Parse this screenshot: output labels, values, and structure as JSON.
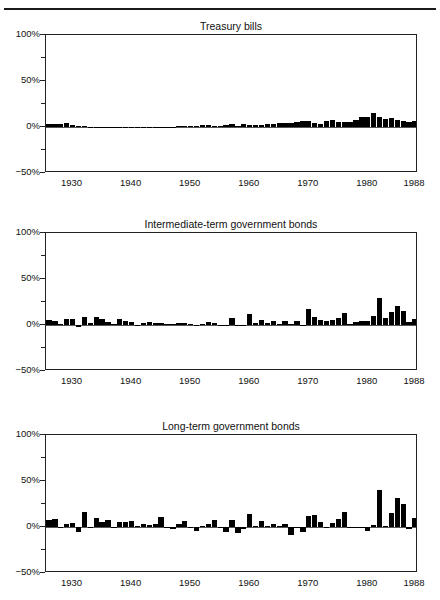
{
  "header": {
    "text": "",
    "rule": true
  },
  "figure": {
    "y_axis": {
      "labels": [
        "100%",
        "50%",
        "0%",
        "−50%"
      ],
      "values": [
        100,
        50,
        0,
        -50
      ],
      "minor_values": [
        75,
        25,
        -25
      ],
      "min": -50,
      "max": 100
    },
    "x_axis": {
      "labels": [
        "1930",
        "1940",
        "1950",
        "1960",
        "1970",
        "1980",
        "1988"
      ],
      "values": [
        1930,
        1940,
        1950,
        1960,
        1970,
        1980,
        1988
      ],
      "min": 1925.5,
      "max": 1988.5
    },
    "colors": {
      "bar": "#000000",
      "axis": "#222222",
      "zero_line": "#555555",
      "text": "#111111"
    }
  },
  "chart_data": [
    {
      "type": "bar",
      "title": "Treasury bills",
      "xlabel": "",
      "ylabel": "",
      "ylim": [
        -50,
        100
      ],
      "xlim": [
        1925.5,
        1988.5
      ],
      "grid": false,
      "legend": "none",
      "x": [
        1926,
        1927,
        1928,
        1929,
        1930,
        1931,
        1932,
        1933,
        1934,
        1935,
        1936,
        1937,
        1938,
        1939,
        1940,
        1941,
        1942,
        1943,
        1944,
        1945,
        1946,
        1947,
        1948,
        1949,
        1950,
        1951,
        1952,
        1953,
        1954,
        1955,
        1956,
        1957,
        1958,
        1959,
        1960,
        1961,
        1962,
        1963,
        1964,
        1965,
        1966,
        1967,
        1968,
        1969,
        1970,
        1971,
        1972,
        1973,
        1974,
        1975,
        1976,
        1977,
        1978,
        1979,
        1980,
        1981,
        1982,
        1983,
        1984,
        1985,
        1986,
        1987,
        1988
      ],
      "values": [
        3.3,
        3.1,
        3.2,
        4.7,
        2.4,
        1.1,
        1.0,
        0.3,
        0.2,
        0.2,
        0.2,
        0.3,
        0.0,
        0.0,
        0.0,
        0.1,
        0.3,
        0.4,
        0.3,
        0.3,
        0.4,
        0.5,
        0.8,
        1.1,
        1.2,
        1.5,
        1.7,
        1.8,
        0.9,
        1.6,
        2.5,
        3.1,
        1.5,
        3.0,
        2.7,
        2.1,
        2.7,
        3.1,
        3.5,
        3.9,
        4.8,
        4.2,
        5.2,
        6.6,
        6.5,
        4.4,
        3.8,
        6.9,
        8.0,
        5.8,
        5.1,
        5.1,
        7.2,
        10.4,
        11.2,
        14.7,
        10.5,
        8.8,
        9.8,
        7.7,
        6.2,
        5.5,
        6.4
      ]
    },
    {
      "type": "bar",
      "title": "Intermediate-term government bonds",
      "xlabel": "",
      "ylabel": "",
      "ylim": [
        -50,
        100
      ],
      "xlim": [
        1925.5,
        1988.5
      ],
      "grid": false,
      "legend": "none",
      "x": [
        1926,
        1927,
        1928,
        1929,
        1930,
        1931,
        1932,
        1933,
        1934,
        1935,
        1936,
        1937,
        1938,
        1939,
        1940,
        1941,
        1942,
        1943,
        1944,
        1945,
        1946,
        1947,
        1948,
        1949,
        1950,
        1951,
        1952,
        1953,
        1954,
        1955,
        1956,
        1957,
        1958,
        1959,
        1960,
        1961,
        1962,
        1963,
        1964,
        1965,
        1966,
        1967,
        1968,
        1969,
        1970,
        1971,
        1972,
        1973,
        1974,
        1975,
        1976,
        1977,
        1978,
        1979,
        1980,
        1981,
        1982,
        1983,
        1984,
        1985,
        1986,
        1987,
        1988
      ],
      "values": [
        5.4,
        4.5,
        0.9,
        6.0,
        6.7,
        -2.3,
        8.8,
        1.8,
        9.0,
        7.0,
        3.1,
        1.6,
        6.2,
        4.5,
        3.0,
        0.5,
        1.9,
        2.8,
        1.8,
        2.2,
        1.0,
        0.9,
        1.8,
        2.3,
        0.7,
        0.4,
        1.6,
        3.2,
        2.7,
        -0.6,
        -0.2,
        7.8,
        -0.9,
        -0.4,
        11.8,
        2.0,
        5.7,
        1.7,
        4.0,
        1.0,
        4.7,
        1.0,
        4.5,
        -0.7,
        16.9,
        8.7,
        5.2,
        4.6,
        5.7,
        7.8,
        12.9,
        1.4,
        3.5,
        4.1,
        3.9,
        9.5,
        29.1,
        7.4,
        14.0,
        20.3,
        15.1,
        2.9,
        6.1
      ]
    },
    {
      "type": "bar",
      "title": "Long-term government bonds",
      "xlabel": "",
      "ylabel": "",
      "ylim": [
        -50,
        100
      ],
      "xlim": [
        1925.5,
        1988.5
      ],
      "grid": false,
      "legend": "none",
      "x": [
        1926,
        1927,
        1928,
        1929,
        1930,
        1931,
        1932,
        1933,
        1934,
        1935,
        1936,
        1937,
        1938,
        1939,
        1940,
        1941,
        1942,
        1943,
        1944,
        1945,
        1946,
        1947,
        1948,
        1949,
        1950,
        1951,
        1952,
        1953,
        1954,
        1955,
        1956,
        1957,
        1958,
        1959,
        1960,
        1961,
        1962,
        1963,
        1964,
        1965,
        1966,
        1967,
        1968,
        1969,
        1970,
        1971,
        1972,
        1973,
        1974,
        1975,
        1976,
        1977,
        1978,
        1979,
        1980,
        1981,
        1982,
        1983,
        1984,
        1985,
        1986,
        1987,
        1988
      ],
      "values": [
        7.8,
        8.9,
        0.1,
        3.4,
        4.7,
        -5.3,
        16.8,
        -0.1,
        10.0,
        5.0,
        7.5,
        0.2,
        5.5,
        5.9,
        6.1,
        0.9,
        3.2,
        2.1,
        2.8,
        10.7,
        -0.1,
        -2.6,
        3.4,
        6.5,
        0.1,
        -4.0,
        1.2,
        3.5,
        7.2,
        -1.3,
        -5.6,
        7.5,
        -6.1,
        -2.3,
        13.8,
        1.0,
        6.9,
        1.2,
        3.5,
        0.7,
        3.7,
        -9.2,
        -0.3,
        -5.1,
        12.1,
        13.2,
        5.7,
        -1.1,
        4.4,
        9.2,
        16.8,
        -0.7,
        -1.2,
        -1.2,
        -4.0,
        1.9,
        40.4,
        0.7,
        15.5,
        31.0,
        24.5,
        -2.7,
        9.7
      ]
    }
  ]
}
